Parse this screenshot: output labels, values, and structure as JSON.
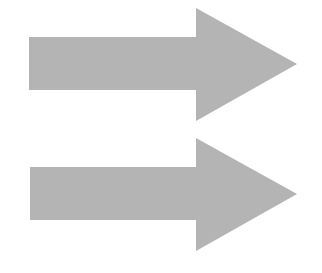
{
  "diagram": {
    "background": "#ffffff",
    "arrows": [
      {
        "id": "arrow-1",
        "direction": "right",
        "fill": "#b4b4b4",
        "points": "29,37 196,37 196,8 297,64 196,121 196,90 29,90"
      },
      {
        "id": "arrow-2",
        "direction": "right",
        "fill": "#b4b4b4",
        "points": "30,167 196,167 196,138 297,194 196,251 196,220 30,220"
      }
    ]
  }
}
